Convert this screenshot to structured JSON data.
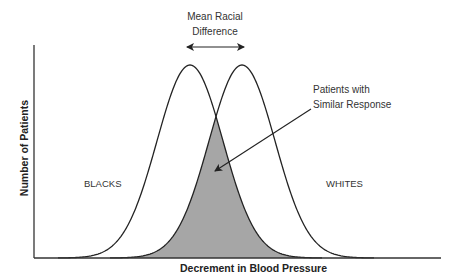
{
  "chart_data": {
    "type": "area",
    "title": "",
    "xlabel": "Decrement in Blood Pressure",
    "ylabel": "Number of Patients",
    "grid": false,
    "legend": "none",
    "series": [
      {
        "name": "BLACKS",
        "distribution": "normal",
        "relative_mean": 0,
        "relative_sd": 1,
        "relative_peak": 1
      },
      {
        "name": "WHITES",
        "distribution": "normal",
        "relative_mean": 1,
        "relative_sd": 1,
        "relative_peak": 1
      }
    ],
    "overlap_region": {
      "label": "Patients with Similar Response",
      "fill": "#a6a6a6"
    },
    "annotations": [
      {
        "text": "Mean Racial Difference",
        "type": "double-arrow between peaks"
      },
      {
        "text": "Patients with Similar Response",
        "type": "arrow pointing into shaded overlap"
      }
    ]
  },
  "labels": {
    "mean_diff_line1": "Mean Racial",
    "mean_diff_line2": "Difference",
    "similar_line1": "Patients with",
    "similar_line2": "Similar Response",
    "blacks": "BLACKS",
    "whites": "WHITES",
    "xlabel": "Decrement in Blood Pressure",
    "ylabel": "Number of Patients"
  },
  "colors": {
    "overlap_fill": "#a6a6a6",
    "line": "#222222",
    "background": "#ffffff"
  }
}
